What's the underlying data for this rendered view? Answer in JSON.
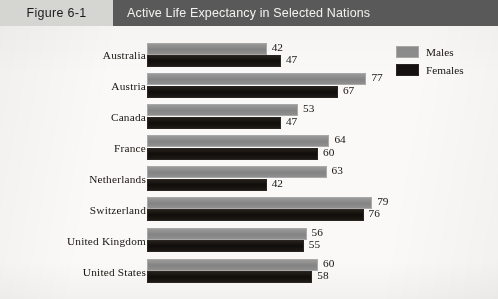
{
  "header": {
    "figure_tag": "Figure 6-1",
    "title": "Active Life Expectancy in Selected Nations",
    "tag_bg": "#d5d5d2",
    "band_bg": "#595959",
    "title_color": "#f2f2f0"
  },
  "legend": {
    "position": "top-right",
    "items": [
      {
        "label": "Males",
        "color": "#8c8c8c"
      },
      {
        "label": "Females",
        "color": "#141110"
      }
    ]
  },
  "chart_data": {
    "type": "bar",
    "orientation": "horizontal",
    "title": "Active Life Expectancy in Selected Nations",
    "xlabel": "",
    "ylabel": "",
    "grid": false,
    "legend_position": "top-right",
    "xlim": [
      0,
      80
    ],
    "categories": [
      "Australia",
      "Austria",
      "Canada",
      "France",
      "Netherlands",
      "Switzerland",
      "United Kingdom",
      "United States"
    ],
    "series": [
      {
        "name": "Males",
        "color": "#8c8c8c",
        "values": [
          42,
          77,
          53,
          64,
          63,
          79,
          56,
          60
        ]
      },
      {
        "name": "Females",
        "color": "#141110",
        "values": [
          47,
          67,
          47,
          60,
          42,
          76,
          55,
          58
        ]
      }
    ],
    "data_labels": true,
    "rows": [
      {
        "category": "Australia",
        "male": 42,
        "female": 47
      },
      {
        "category": "Austria",
        "male": 77,
        "female": 67
      },
      {
        "category": "Canada",
        "male": 53,
        "female": 47
      },
      {
        "category": "France",
        "male": 64,
        "female": 60
      },
      {
        "category": "Netherlands",
        "male": 63,
        "female": 42
      },
      {
        "category": "Switzerland",
        "male": 79,
        "female": 76
      },
      {
        "category": "United Kingdom",
        "male": 56,
        "female": 55
      },
      {
        "category": "United States",
        "male": 60,
        "female": 58
      }
    ]
  }
}
